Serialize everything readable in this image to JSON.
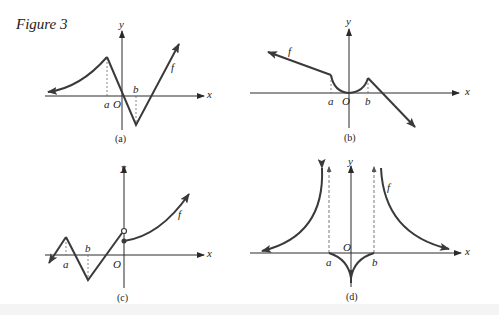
{
  "figure": {
    "title": "Figure 3",
    "colors": {
      "curve": "#3a3a3a",
      "axis": "#2a2a2a",
      "dashed": "#666666",
      "text": "#222222"
    },
    "panels": [
      {
        "id": "a",
        "caption": "(a)",
        "x_label": "x",
        "y_label": "y",
        "origin_label": "O",
        "point_labels": [
          "a",
          "b"
        ],
        "function_label": "f"
      },
      {
        "id": "b",
        "caption": "(b)",
        "x_label": "x",
        "y_label": "y",
        "origin_label": "O",
        "point_labels": [
          "a",
          "b"
        ],
        "function_label": "f"
      },
      {
        "id": "c",
        "caption": "(c)",
        "x_label": "x",
        "y_label": "y",
        "origin_label": "O",
        "point_labels": [
          "a",
          "b"
        ],
        "function_label": "f"
      },
      {
        "id": "d",
        "caption": "(d)",
        "x_label": "x",
        "y_label": "y",
        "origin_label": "O",
        "point_labels": [
          "a",
          "b"
        ],
        "function_label": "f"
      }
    ]
  }
}
